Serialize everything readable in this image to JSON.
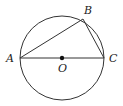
{
  "diagram": {
    "type": "geometry-circle",
    "circle": {
      "center_label": "O",
      "cx": 62,
      "cy": 58,
      "r": 42
    },
    "points": {
      "A": {
        "label": "A",
        "x": 20,
        "y": 58
      },
      "B": {
        "label": "B",
        "x": 83,
        "y": 19
      },
      "C": {
        "label": "C",
        "x": 104,
        "y": 58
      },
      "O": {
        "label": "O",
        "x": 62,
        "y": 58
      }
    },
    "segments": [
      {
        "from": "A",
        "to": "C",
        "note": "diameter through O"
      },
      {
        "from": "A",
        "to": "B"
      },
      {
        "from": "B",
        "to": "C"
      }
    ],
    "colors": {
      "stroke": "#333333",
      "label": "#222222",
      "background": "#ffffff"
    }
  }
}
